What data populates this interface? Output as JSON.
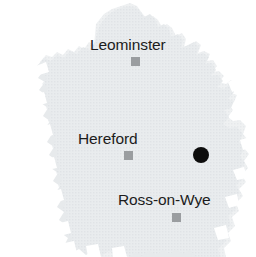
{
  "map": {
    "title": "Herefordshire county outline map",
    "background_color": "#ffffff",
    "land_fill_color": "#e7eaec",
    "land_texture_color": "#dadee1",
    "width": 256,
    "height": 257
  },
  "cities": [
    {
      "name": "Leominster",
      "label_x": 90,
      "label_y": 37,
      "marker_x": 131,
      "marker_y": 57,
      "marker_color": "#9a9da0"
    },
    {
      "name": "Hereford",
      "label_x": 78,
      "label_y": 131,
      "marker_x": 124,
      "marker_y": 151,
      "marker_color": "#9a9da0"
    },
    {
      "name": "Ross-on-Wye",
      "label_x": 118,
      "label_y": 192,
      "marker_x": 172,
      "marker_y": 213,
      "marker_color": "#9a9da0"
    }
  ],
  "site_marker": {
    "name": "site-location",
    "x": 193,
    "y": 147,
    "diameter": 16,
    "color": "#0d0d0d"
  }
}
